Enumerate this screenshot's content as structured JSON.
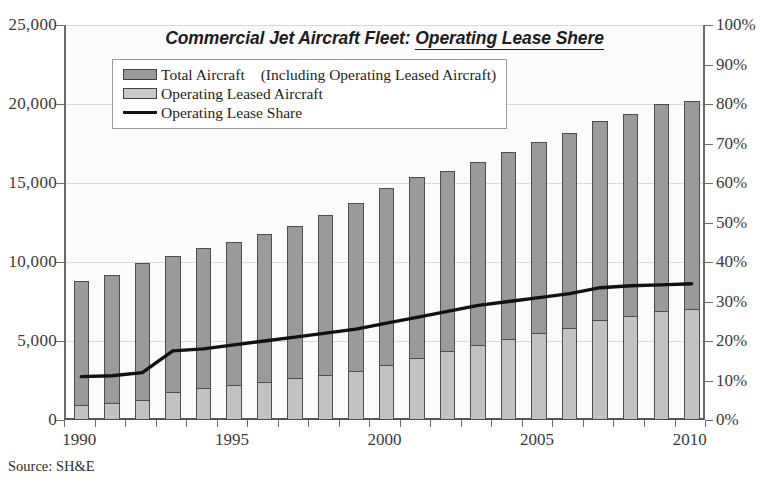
{
  "title": {
    "plain": "Commercial Jet Aircraft Fleet: ",
    "underlined": "Operating Lease Shere",
    "full": "Commercial Jet Aircraft Fleet: Operating Lease Shere"
  },
  "legend": {
    "items": [
      {
        "label": "Total Aircraft　(Including Operating Leased Aircraft)",
        "marker": "filled-square-dark"
      },
      {
        "label": "Operating Leased Aircraft",
        "marker": "filled-square-light"
      },
      {
        "label": "Operating Lease Share",
        "marker": "solid-line"
      }
    ]
  },
  "source": "Source: SH&E",
  "axes": {
    "left_ticks": [
      "0",
      "5,000",
      "10,000",
      "15,000",
      "20,000",
      "25,000"
    ],
    "right_ticks": [
      "0%",
      "10%",
      "20%",
      "30%",
      "40%",
      "50%",
      "60%",
      "70%",
      "80%",
      "90%",
      "100%"
    ],
    "x_ticks": [
      "1990",
      "1995",
      "2000",
      "2005",
      "2010"
    ]
  },
  "colors": {
    "total_bar": "#9a9a9a",
    "leased_bar": "#c2c2c2",
    "bar_outline": "#4d4d4d",
    "line": "#111111",
    "gridline": "#d9d9d9",
    "axis": "#6b6b6b",
    "plot_background": "#fbfbfb",
    "page_background": "#ffffff"
  },
  "chart_data": {
    "type": "bar",
    "title": "Commercial Jet Aircraft Fleet: Operating Lease Shere",
    "subtitle": "",
    "xlabel": "",
    "ylabel": "",
    "y2label": "",
    "grid": true,
    "legend_position": "top-left inside plot",
    "categories": [
      1990,
      1991,
      1992,
      1993,
      1994,
      1995,
      1996,
      1997,
      1998,
      1999,
      2000,
      2001,
      2002,
      2003,
      2004,
      2005,
      2006,
      2007,
      2008,
      2009,
      2010
    ],
    "ylim": [
      0,
      25000
    ],
    "ytick_step": 5000,
    "y2lim": [
      0,
      100
    ],
    "y2tick_step": 10,
    "y2_unit": "%",
    "series": [
      {
        "name": "Total Aircraft　(Including Operating Leased Aircraft)",
        "type": "bar",
        "axis": "left",
        "values": [
          8800,
          9200,
          9950,
          10400,
          10900,
          11300,
          11750,
          12300,
          13000,
          13750,
          14700,
          15400,
          15750,
          16350,
          16950,
          17600,
          18150,
          18950,
          19350,
          20000,
          20200
        ]
      },
      {
        "name": "Operating Leased Aircraft",
        "type": "bar",
        "axis": "left",
        "values": [
          950,
          1050,
          1250,
          1800,
          2000,
          2200,
          2400,
          2650,
          2850,
          3100,
          3500,
          3900,
          4350,
          4750,
          5150,
          5500,
          5850,
          6350,
          6600,
          6900,
          7000
        ]
      },
      {
        "name": "Operating Lease Share",
        "type": "line",
        "axis": "right",
        "unit": "%",
        "values": [
          11.0,
          11.2,
          12.0,
          17.5,
          18.0,
          19.0,
          20.0,
          21.0,
          22.0,
          23.0,
          24.5,
          26.0,
          27.5,
          29.0,
          30.0,
          31.0,
          32.0,
          33.5,
          34.0,
          34.2,
          34.5
        ]
      }
    ]
  }
}
